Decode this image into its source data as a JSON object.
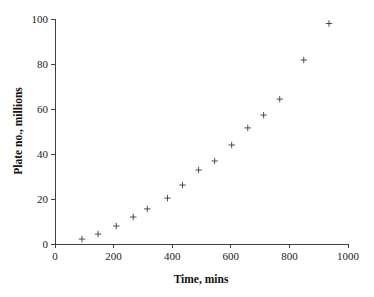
{
  "chart_data": {
    "type": "scatter",
    "title": "",
    "xlabel": "Time, mins",
    "ylabel": "Plate no., millions",
    "xlim": [
      0,
      1000
    ],
    "ylim": [
      0,
      100
    ],
    "xticks": [
      0,
      200,
      400,
      600,
      800,
      1000
    ],
    "yticks": [
      0,
      20,
      40,
      60,
      80,
      100
    ],
    "xtick_labels": [
      "0",
      "200",
      "400",
      "600",
      "800",
      "1000"
    ],
    "ytick_labels": [
      "0",
      "20",
      "40",
      "60",
      "80",
      "100"
    ],
    "grid": false,
    "legend": null,
    "marker": "plus",
    "marker_color": "#3a3a3a",
    "series": [
      {
        "name": "Plate no.",
        "x": [
          92,
          147,
          209,
          267,
          315,
          384,
          435,
          490,
          545,
          603,
          658,
          712,
          767,
          849,
          935
        ],
        "y": [
          2.2,
          4.4,
          8.0,
          12.0,
          15.6,
          20.4,
          26.2,
          32.9,
          36.9,
          44.0,
          51.6,
          57.3,
          64.4,
          81.8,
          98.0
        ]
      }
    ]
  },
  "axes": {
    "x_title": "Time, mins",
    "y_title": "Plate no., millions"
  }
}
